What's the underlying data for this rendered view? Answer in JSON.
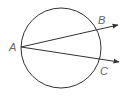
{
  "diagram": {
    "type": "circle-with-rays",
    "circle": {
      "cx": 61,
      "cy": 48,
      "r": 40
    },
    "points": [
      {
        "label": "A",
        "x": 21,
        "y": 47
      },
      {
        "label": "B",
        "x": 97,
        "y": 29
      },
      {
        "label": "C",
        "x": 100,
        "y": 60
      }
    ],
    "rays": [
      {
        "from": "A",
        "through": "B",
        "end": {
          "x": 119,
          "y": 24
        }
      },
      {
        "from": "A",
        "through": "C",
        "end": {
          "x": 120,
          "y": 62
        }
      }
    ],
    "labels": {
      "a": "A",
      "b": "B",
      "c": "C"
    },
    "colors": {
      "stroke": "#333333",
      "label": "#666666"
    }
  }
}
